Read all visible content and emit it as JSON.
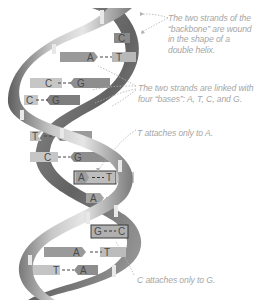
{
  "colors": {
    "ribbon_dark": "#6e6e6e",
    "ribbon_mid": "#9a9a9a",
    "ribbon_light": "#d6d6d6",
    "base_bar": "#b8b8b8",
    "base_bar_dark": "#8a8a8a",
    "annotation_text": "#a6a6a6",
    "leader_line": "#b0b0b0"
  },
  "annotations": [
    {
      "id": "backbone",
      "lines": [
        "The two strands of the",
        "“backbone” are wound",
        "in the shape of a",
        "double helix."
      ]
    },
    {
      "id": "bases",
      "lines": [
        "The two strands are linked with",
        "four “bases”: A, T, C, and G."
      ]
    },
    {
      "id": "t-to-a",
      "lines": [
        "T attaches only to A."
      ]
    },
    {
      "id": "c-to-g",
      "lines": [
        "C attaches only to G."
      ]
    }
  ],
  "base_pairs": [
    {
      "left": "",
      "right": "C",
      "y": 38
    },
    {
      "left": "A",
      "right": "T",
      "y": 58
    },
    {
      "left": "C",
      "right": "G",
      "y": 83
    },
    {
      "left": "C",
      "right": "G",
      "y": 100
    },
    {
      "left": "T",
      "right": "A",
      "y": 136
    },
    {
      "left": "C",
      "right": "G",
      "y": 157
    },
    {
      "left": "A",
      "right": "T",
      "y": 177,
      "highlighted": true
    },
    {
      "left": "A",
      "right": "T",
      "y": 198
    },
    {
      "left": "G",
      "right": "C",
      "y": 232,
      "highlighted": true
    },
    {
      "left": "A",
      "right": "T",
      "y": 251
    },
    {
      "left": "T",
      "right": "A",
      "y": 270
    }
  ]
}
